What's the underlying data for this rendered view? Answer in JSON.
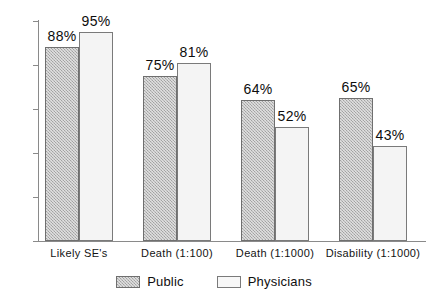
{
  "chart_data": {
    "type": "bar",
    "title": "",
    "subtitle": "",
    "xlabel": "",
    "ylabel": "",
    "ylim": [
      0,
      100
    ],
    "yticks": [
      0,
      20,
      40,
      60,
      80,
      100
    ],
    "ytick_labels": [
      "0",
      "20",
      "40",
      "60",
      "80",
      "100"
    ],
    "grid": false,
    "legend_position": "bottom-center",
    "categories": [
      "Likely SE's",
      "Death (1:100)",
      "Death (1:1000)",
      "Disability (1:1000)"
    ],
    "series": [
      {
        "name": "Public",
        "values": [
          88,
          75,
          64,
          65
        ],
        "value_labels": [
          "88%",
          "75%",
          "64%",
          "65%"
        ],
        "fill": "hatched-gray",
        "color": "#b8b8b8"
      },
      {
        "name": "Physicians",
        "values": [
          95,
          81,
          52,
          43
        ],
        "value_labels": [
          "95%",
          "81%",
          "52%",
          "43%"
        ],
        "fill": "solid-white",
        "color": "#f4f4f4"
      }
    ]
  },
  "legend": {
    "items": [
      {
        "label": "Public",
        "swatch": "hatched-gray-swatch"
      },
      {
        "label": "Physicians",
        "swatch": "white-swatch"
      }
    ]
  }
}
